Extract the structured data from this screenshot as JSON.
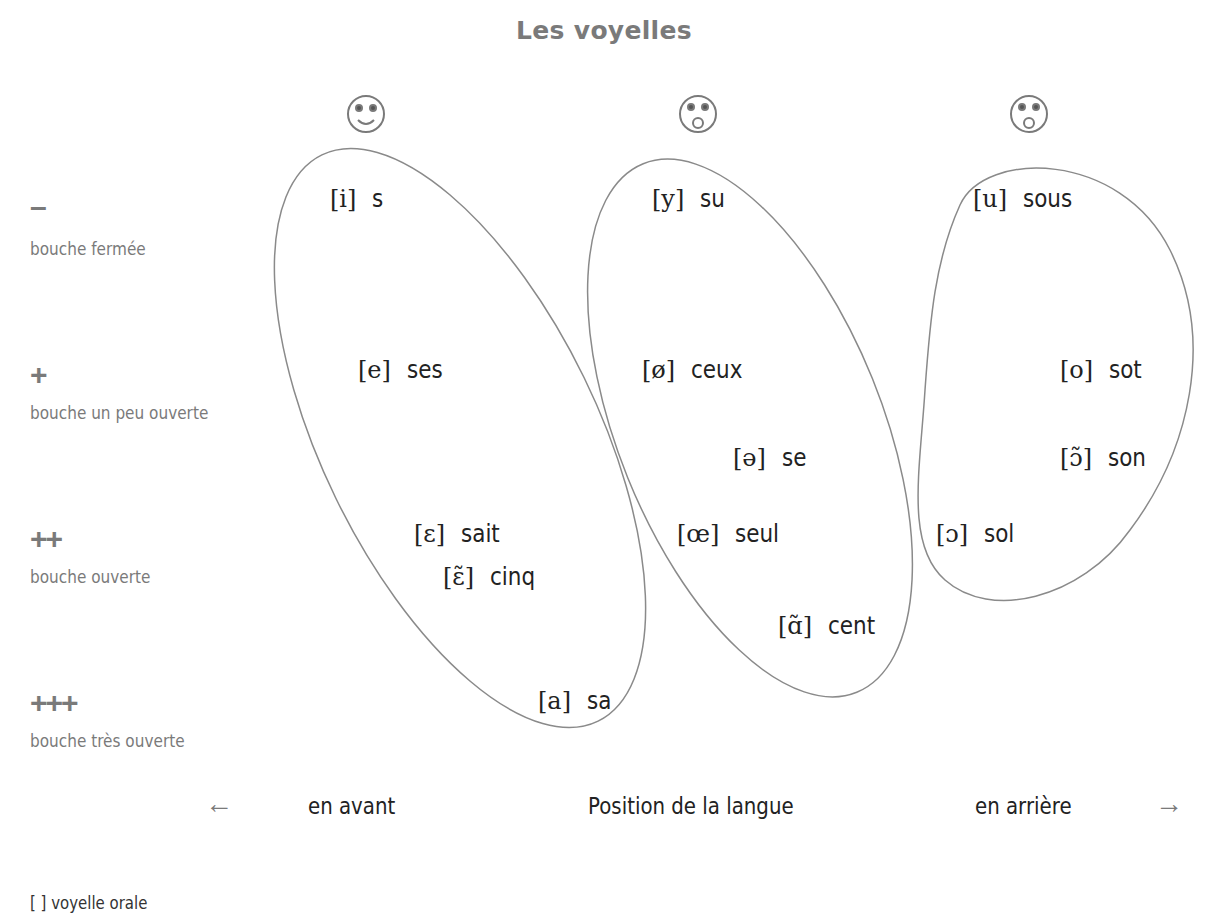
{
  "title": "Les voyelles",
  "faces": [
    {
      "name": "smiling-face-icon",
      "mouth": "smile",
      "x": 366,
      "y": 114
    },
    {
      "name": "rounded-mouth-face-icon",
      "mouth": "round",
      "x": 698,
      "y": 114
    },
    {
      "name": "rounded-mouth-face-icon",
      "mouth": "round",
      "x": 1029,
      "y": 114
    }
  ],
  "rows": [
    {
      "symbol": "–",
      "label": "bouche fermée"
    },
    {
      "symbol": "+",
      "label": "bouche un peu ouverte"
    },
    {
      "symbol": "++",
      "label": "bouche ouverte"
    },
    {
      "symbol": "+++",
      "label": "bouche très ouverte"
    }
  ],
  "groups": {
    "front_unrounded": [
      {
        "ipa": "[i]",
        "word": "s"
      },
      {
        "ipa": "[e]",
        "word": "ses"
      },
      {
        "ipa": "[ɛ]",
        "word": "sait"
      },
      {
        "ipa": "[ɛ̃]",
        "word": "cinq"
      },
      {
        "ipa": "[a]",
        "word": "sa"
      }
    ],
    "front_rounded": [
      {
        "ipa": "[y]",
        "word": "su"
      },
      {
        "ipa": "[ø]",
        "word": "ceux"
      },
      {
        "ipa": "[ə]",
        "word": "se"
      },
      {
        "ipa": "[œ]",
        "word": "seul"
      },
      {
        "ipa": "[ɑ̃]",
        "word": "cent"
      }
    ],
    "back": [
      {
        "ipa": "[u]",
        "word": "sous"
      },
      {
        "ipa": "[o]",
        "word": "sot"
      },
      {
        "ipa": "[ɔ̃]",
        "word": "son"
      },
      {
        "ipa": "[ɔ]",
        "word": "sol"
      }
    ]
  },
  "axis": {
    "left_arrow": "←",
    "left_label": "en avant",
    "center_label": "Position de la langue",
    "right_label": "en arrière",
    "right_arrow": "→"
  },
  "legend": "[ ] voyelle orale",
  "colors": {
    "accent_gray": "#7a7a7a",
    "outline": "#8a8a8a",
    "text": "#222222"
  }
}
